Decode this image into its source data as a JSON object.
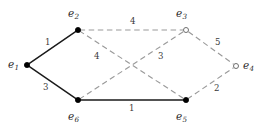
{
  "figure": {
    "kind": "weighted-graph-diagram",
    "width": 265,
    "height": 130,
    "background_color": "#ffffff"
  },
  "chart_data": {
    "type": "diagram",
    "title": "",
    "xlabel": "",
    "ylabel": "",
    "grid": false,
    "legend": "none",
    "colors": {
      "solid_edge": "#1a1a1a",
      "dashed_edge": "#9a9a9a",
      "filled_node": "#000000",
      "hollow_node_stroke": "#6f6f6f",
      "hollow_node_fill": "#ffffff",
      "text": "#2a2a2a"
    },
    "nodes": [
      {
        "id": "e1",
        "base": "e",
        "sub": "1",
        "x": 27,
        "y": 65,
        "style": "filled",
        "label_x": 8,
        "label_y": 59
      },
      {
        "id": "e2",
        "base": "e",
        "sub": "2",
        "x": 78,
        "y": 30,
        "style": "filled",
        "label_x": 68,
        "label_y": 8
      },
      {
        "id": "e3",
        "base": "e",
        "sub": "3",
        "x": 186,
        "y": 30,
        "style": "hollow",
        "label_x": 176,
        "label_y": 8
      },
      {
        "id": "e4",
        "base": "e",
        "sub": "4",
        "x": 236,
        "y": 66,
        "style": "hollow",
        "label_x": 243,
        "label_y": 60
      },
      {
        "id": "e5",
        "base": "e",
        "sub": "5",
        "x": 186,
        "y": 100,
        "style": "filled",
        "label_x": 176,
        "label_y": 111
      },
      {
        "id": "e6",
        "base": "e",
        "sub": "6",
        "x": 78,
        "y": 100,
        "style": "filled",
        "label_x": 68,
        "label_y": 111
      }
    ],
    "edges": [
      {
        "from": "e1",
        "to": "e2",
        "weight": "1",
        "style": "solid",
        "label_x": 45,
        "label_y": 38
      },
      {
        "from": "e1",
        "to": "e6",
        "weight": "3",
        "style": "solid",
        "label_x": 43,
        "label_y": 83
      },
      {
        "from": "e6",
        "to": "e5",
        "weight": "1",
        "style": "solid",
        "label_x": 129,
        "label_y": 104
      },
      {
        "from": "e2",
        "to": "e3",
        "weight": "4",
        "style": "dashed",
        "label_x": 130,
        "label_y": 17
      },
      {
        "from": "e2",
        "to": "e5",
        "weight": "4",
        "style": "dashed",
        "label_x": 94,
        "label_y": 52
      },
      {
        "from": "e6",
        "to": "e3",
        "weight": "3",
        "style": "dashed",
        "label_x": 158,
        "label_y": 52
      },
      {
        "from": "e3",
        "to": "e4",
        "weight": "5",
        "style": "dashed",
        "label_x": 215,
        "label_y": 38
      },
      {
        "from": "e5",
        "to": "e4",
        "weight": "2",
        "style": "dashed",
        "label_x": 214,
        "label_y": 84
      }
    ]
  }
}
